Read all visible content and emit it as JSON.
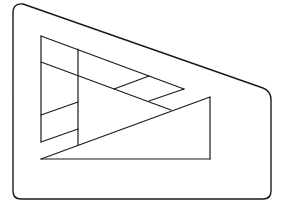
{
  "figure": {
    "title": "",
    "stroke_color": "#1a1a1a",
    "background": "#ffffff",
    "outer_frame": {
      "path": "M 13 13 Q 13 3 23 4 L 263 88 Q 271 91 271 100 L 271 191 Q 271 199 263 199 L 21 199 Q 13 199 13 191 Z",
      "stroke_width": 1.4
    },
    "inner_lines": [
      {
        "name": "left-triangle-top-edge",
        "x1": 41,
        "y1": 36,
        "x2": 184,
        "y2": 89
      },
      {
        "name": "left-triangle-left-edge",
        "x1": 41,
        "y1": 36,
        "x2": 41,
        "y2": 142
      },
      {
        "name": "inner-slant-line",
        "x1": 41,
        "y1": 62,
        "x2": 171,
        "y2": 110
      },
      {
        "name": "left-triangle-lower-edge",
        "x1": 184,
        "y1": 89,
        "x2": 149,
        "y2": 101
      },
      {
        "name": "parallelogram-divider",
        "x1": 149,
        "y1": 76,
        "x2": 114,
        "y2": 89
      },
      {
        "name": "vertical-divider",
        "x1": 78,
        "y1": 49,
        "x2": 78,
        "y2": 145
      },
      {
        "name": "left-slat-upper",
        "x1": 41,
        "y1": 115,
        "x2": 78,
        "y2": 102
      },
      {
        "name": "left-slat-lower",
        "x1": 41,
        "y1": 142,
        "x2": 78,
        "y2": 129
      },
      {
        "name": "right-triangle-hypotenuse",
        "x1": 41,
        "y1": 159,
        "x2": 210,
        "y2": 97
      },
      {
        "name": "right-triangle-vertical",
        "x1": 210,
        "y1": 97,
        "x2": 210,
        "y2": 159
      },
      {
        "name": "right-triangle-base",
        "x1": 41,
        "y1": 159,
        "x2": 210,
        "y2": 159
      }
    ],
    "inner_stroke_width": 1.2
  }
}
